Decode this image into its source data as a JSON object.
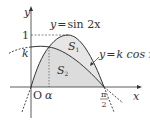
{
  "diagram": {
    "axes": {
      "x_label": "x",
      "y_label": "y",
      "origin_label": "O"
    },
    "y_ticks": {
      "one": "1",
      "k": "k"
    },
    "x_ticks": {
      "alpha": "α",
      "half_pi_num": "π",
      "half_pi_den": "2"
    },
    "curves": [
      {
        "name": "sine",
        "label_y": "y",
        "label_eq": "=",
        "label_rhs": "sin 2x"
      },
      {
        "name": "cosine",
        "label_y": "y",
        "label_eq": "=",
        "label_rhs": "k cos x"
      }
    ],
    "regions": [
      {
        "name": "S",
        "sub": "1"
      },
      {
        "name": "S",
        "sub": "2"
      }
    ],
    "colors": {
      "shade": "#d9d9d9",
      "stroke": "#333333",
      "dash": "#555555"
    }
  }
}
